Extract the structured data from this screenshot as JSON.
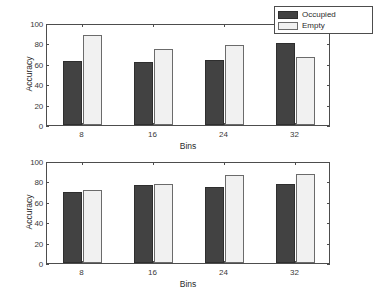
{
  "chart_data": [
    {
      "type": "bar",
      "panel": "top",
      "title": "",
      "xlabel": "Bins",
      "ylabel": "Accuracy",
      "categories": [
        "8",
        "16",
        "24",
        "32"
      ],
      "ylim": [
        0,
        100
      ],
      "yticks": [
        0,
        20,
        40,
        60,
        80,
        100
      ],
      "ytick_labels": [
        "0",
        "20",
        "40",
        "60",
        "80",
        "100"
      ],
      "grid": false,
      "legend_position": "top-right",
      "series": [
        {
          "name": "Occupied",
          "color": "#424242",
          "values": [
            63,
            62,
            64,
            80
          ]
        },
        {
          "name": "Empty",
          "color": "#f1f1f1",
          "values": [
            88,
            75,
            78,
            67
          ]
        }
      ]
    },
    {
      "type": "bar",
      "panel": "bottom",
      "title": "",
      "xlabel": "Bins",
      "ylabel": "Accuracy",
      "categories": [
        "8",
        "16",
        "24",
        "32"
      ],
      "ylim": [
        0,
        100
      ],
      "yticks": [
        0,
        20,
        40,
        60,
        80,
        100
      ],
      "ytick_labels": [
        "0",
        "20",
        "40",
        "60",
        "80",
        "100"
      ],
      "grid": false,
      "legend_position": "none",
      "series": [
        {
          "name": "Occupied",
          "color": "#424242",
          "values": [
            70,
            76,
            75,
            77
          ]
        },
        {
          "name": "Empty",
          "color": "#f1f1f1",
          "values": [
            72,
            77,
            86,
            87
          ]
        }
      ]
    }
  ],
  "legend": {
    "items": [
      {
        "label": "Occupied",
        "color": "#424242"
      },
      {
        "label": "Empty",
        "color": "#f1f1f1"
      }
    ]
  },
  "colors": {
    "occupied": "#424242",
    "empty": "#f1f1f1",
    "axis": "#4d4d4d",
    "text": "#2b2b2b",
    "background": "#ffffff"
  }
}
